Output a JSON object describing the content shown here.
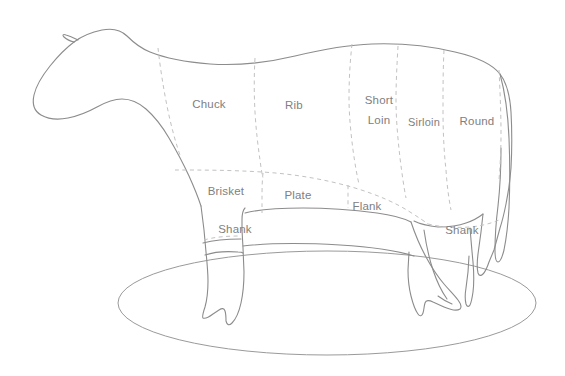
{
  "diagram": {
    "orientation": "facing-left",
    "colors": {
      "outline": "#8c8c8c",
      "divider": "#c2c2c2",
      "label_text": "#808080",
      "ground": "#9a9a9a",
      "background": "#ffffff"
    },
    "labels": {
      "chuck": "Chuck",
      "rib": "Rib",
      "short_loin_line1": "Short",
      "short_loin_line2": "Loin",
      "sirloin": "Sirloin",
      "round": "Round",
      "brisket": "Brisket",
      "plate": "Plate",
      "flank": "Flank",
      "shank_front": "Shank",
      "shank_rear": "Shank"
    },
    "cuts": [
      {
        "name": "Chuck",
        "row": "upper",
        "order": 1,
        "label_x": 209,
        "label_y": 105
      },
      {
        "name": "Rib",
        "row": "upper",
        "order": 2,
        "label_x": 294,
        "label_y": 106
      },
      {
        "name": "Short Loin",
        "row": "upper",
        "order": 3,
        "label_x": 379,
        "label_y": 113
      },
      {
        "name": "Sirloin",
        "row": "upper",
        "order": 4,
        "label_x": 424,
        "label_y": 123
      },
      {
        "name": "Round",
        "row": "upper",
        "order": 5,
        "label_x": 477,
        "label_y": 122
      },
      {
        "name": "Brisket",
        "row": "lower",
        "order": 1,
        "label_x": 226,
        "label_y": 192
      },
      {
        "name": "Plate",
        "row": "lower",
        "order": 2,
        "label_x": 298,
        "label_y": 196
      },
      {
        "name": "Flank",
        "row": "lower",
        "order": 3,
        "label_x": 367,
        "label_y": 207
      },
      {
        "name": "Shank",
        "row": "leg",
        "order": 1,
        "label_x": 235,
        "label_y": 230
      },
      {
        "name": "Shank",
        "row": "leg",
        "order": 2,
        "label_x": 462,
        "label_y": 231
      }
    ]
  }
}
